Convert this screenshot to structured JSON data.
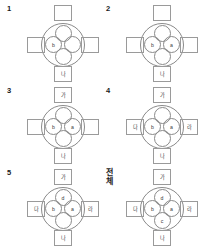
{
  "figure": {
    "type": "diagram",
    "columns": 2,
    "rows": 3,
    "colors": {
      "stroke": "#8a8a8a",
      "square_stroke": "#9a9a9a",
      "text": "#3a3a3a",
      "panel_label": "#1a1a1a",
      "background": "#ffffff"
    }
  },
  "panels": [
    {
      "id": "panel-1",
      "label": "1",
      "label_is_korean": false,
      "circles": {
        "top": "",
        "left": "b",
        "right": "",
        "bottom": ""
      },
      "squares": {
        "top": "",
        "left": "",
        "right": "",
        "bottom": "나"
      }
    },
    {
      "id": "panel-2",
      "label": "2",
      "label_is_korean": false,
      "circles": {
        "top": "",
        "left": "b",
        "right": "a",
        "bottom": ""
      },
      "squares": {
        "top": "",
        "left": "",
        "right": "",
        "bottom": "나"
      }
    },
    {
      "id": "panel-3",
      "label": "3",
      "label_is_korean": false,
      "circles": {
        "top": "",
        "left": "b",
        "right": "a",
        "bottom": ""
      },
      "squares": {
        "top": "가",
        "left": "",
        "right": "",
        "bottom": "나"
      }
    },
    {
      "id": "panel-4",
      "label": "4",
      "label_is_korean": false,
      "circles": {
        "top": "",
        "left": "b",
        "right": "a",
        "bottom": ""
      },
      "squares": {
        "top": "가",
        "left": "다",
        "right": "라",
        "bottom": "나"
      }
    },
    {
      "id": "panel-5",
      "label": "5",
      "label_is_korean": false,
      "circles": {
        "top": "d",
        "left": "b",
        "right": "a",
        "bottom": ""
      },
      "squares": {
        "top": "가",
        "left": "다",
        "right": "라",
        "bottom": "나"
      }
    },
    {
      "id": "panel-all",
      "label": "전\n체",
      "label_is_korean": true,
      "circles": {
        "top": "d",
        "left": "b",
        "right": "a",
        "bottom": "c"
      },
      "squares": {
        "top": "가",
        "left": "다",
        "right": "라",
        "bottom": "나"
      }
    }
  ]
}
